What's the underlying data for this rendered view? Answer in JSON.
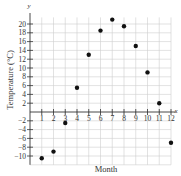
{
  "chart_data": {
    "type": "scatter",
    "title": "",
    "xlabel": "Month",
    "ylabel": "Temperature (°C)",
    "x_axis_name": "x",
    "y_axis_name": "y",
    "x": [
      1,
      2,
      3,
      4,
      5,
      6,
      7,
      8,
      9,
      10,
      11,
      12
    ],
    "values": [
      -10.5,
      -9,
      -2.5,
      5.5,
      13,
      18.5,
      21,
      19.5,
      15,
      9,
      2,
      -7
    ],
    "x_ticks": [
      "1",
      "2",
      "3",
      "4",
      "5",
      "6",
      "7",
      "8",
      "9",
      "10",
      "11",
      "12"
    ],
    "y_ticks": [
      "−10",
      "−8",
      "−6",
      "−4",
      "−2",
      "2",
      "4",
      "6",
      "8",
      "10",
      "12",
      "14",
      "16",
      "18",
      "20"
    ],
    "xlim": [
      0,
      12
    ],
    "ylim": [
      -12,
      22
    ],
    "grid": true,
    "legend": "none",
    "marker_color": "#111111",
    "grid_color": "#cfcfcf"
  }
}
